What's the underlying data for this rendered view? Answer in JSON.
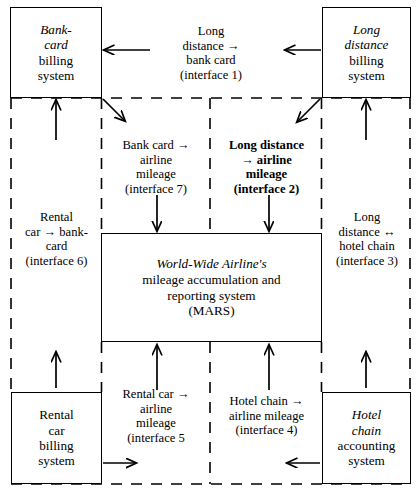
{
  "diagram": {
    "system_boundary_style": "dashed",
    "colors": {
      "line": "#000000",
      "background": "#ffffff"
    },
    "nodes": [
      {
        "id": "bank-card-billing",
        "name": "bank-card-billing-system",
        "line1": "Bank-",
        "line2": "card",
        "line3": "billing",
        "line4": "system"
      },
      {
        "id": "long-distance-billing",
        "name": "long-distance-billing-system",
        "line1": "Long",
        "line2": "distance",
        "line3": "billing",
        "line4": "system"
      },
      {
        "id": "rental-car-billing",
        "name": "rental-car-billing-system",
        "line1": "Rental",
        "line2": "car",
        "line3": "billing",
        "line4": "system"
      },
      {
        "id": "hotel-chain-accounting",
        "name": "hotel-chain-accounting-system",
        "line1": "Hotel",
        "line2": "chain",
        "line3": "accounting",
        "line4": "system"
      },
      {
        "id": "mars",
        "name": "mars-central-system",
        "line1": "World-Wide Airline's",
        "line2": "mileage accumulation and",
        "line3": "reporting system",
        "line4": "(MARS)"
      }
    ],
    "interfaces": [
      {
        "id": "interface-1",
        "name": "interface-long-distance-to-bank-card",
        "bold": false,
        "line1": "Long",
        "line2": "distance →",
        "line3": "bank card",
        "line4": "(interface 1)"
      },
      {
        "id": "interface-7",
        "name": "interface-bank-card-to-airline-mileage",
        "bold": false,
        "line1": "Bank card →",
        "line2": "airline",
        "line3": "mileage",
        "line4": "(interface 7)"
      },
      {
        "id": "interface-2",
        "name": "interface-long-distance-to-airline-mileage",
        "bold": true,
        "line1": "Long distance",
        "line2": "→ airline",
        "line3": "mileage",
        "line4": "(interface 2)"
      },
      {
        "id": "interface-6",
        "name": "interface-rental-car-to-bank-card",
        "bold": false,
        "line1": "Rental",
        "line2": "car → bank-",
        "line3": "card",
        "line4": "(interface 6)"
      },
      {
        "id": "interface-3",
        "name": "interface-long-distance-hotel-chain",
        "bold": false,
        "line1": "Long",
        "line2": "distance ↔",
        "line3": "hotel chain",
        "line4": "(interface 3)"
      },
      {
        "id": "interface-5",
        "name": "interface-rental-car-to-airline-mileage",
        "bold": false,
        "line1": "Rental car →",
        "line2": "airline",
        "line3": "mileage",
        "line4": "(interface 5"
      },
      {
        "id": "interface-4",
        "name": "interface-hotel-chain-to-airline-mileage",
        "bold": false,
        "line1": "Hotel chain →",
        "line2": "airline mileage",
        "line3": "(interface 4)",
        "line4": ""
      }
    ]
  }
}
